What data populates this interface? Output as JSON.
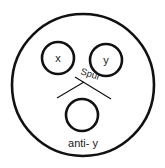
{
  "diagram": {
    "labels": {
      "x": "x",
      "y": "y",
      "spur": "Spur",
      "anti_y": "anti- y"
    },
    "colors": {
      "stroke": "#111111",
      "background": "#ffffff"
    }
  }
}
